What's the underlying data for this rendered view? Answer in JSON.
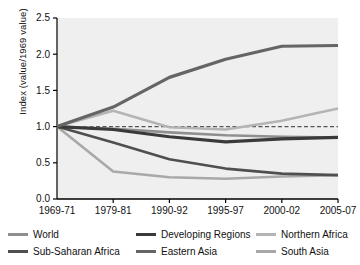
{
  "chart_data": {
    "type": "line",
    "title": "",
    "xlabel": "",
    "ylabel": "Index  (value/1969 value)",
    "categories": [
      "1969-71",
      "1979-81",
      "1990-92",
      "1995-97",
      "2000-02",
      "2005-07"
    ],
    "ylim": [
      0.0,
      2.5
    ],
    "yticks": [
      "0.0",
      "0.5",
      "1.0",
      "1.5",
      "2.0",
      "2.5"
    ],
    "ytick_values": [
      0.0,
      0.5,
      1.0,
      1.5,
      2.0,
      2.5
    ],
    "grid": false,
    "legend_position": "below",
    "reference_line": {
      "value": 1.0,
      "style": "dashed",
      "color": "#555555"
    },
    "plot_background": "#efefef",
    "series": [
      {
        "name": "World",
        "color": "#8f8f8f",
        "width": 2.6,
        "values": [
          1.0,
          0.97,
          0.92,
          0.88,
          0.86,
          0.85
        ]
      },
      {
        "name": "Developing Regions",
        "color": "#3a3a3a",
        "width": 3.2,
        "values": [
          1.0,
          0.96,
          0.86,
          0.79,
          0.83,
          0.85
        ]
      },
      {
        "name": "Northern Africa",
        "color": "#b4b4b4",
        "width": 2.6,
        "values": [
          1.0,
          1.22,
          0.99,
          0.96,
          1.08,
          1.25
        ]
      },
      {
        "name": "Sub-Saharan Africa",
        "color": "#4f4f4f",
        "width": 2.6,
        "values": [
          1.0,
          0.78,
          0.55,
          0.42,
          0.35,
          0.33
        ]
      },
      {
        "name": "Eastern Asia",
        "color": "#656565",
        "width": 3.2,
        "values": [
          1.0,
          1.27,
          1.68,
          1.93,
          2.11,
          2.12
        ]
      },
      {
        "name": "South Asia",
        "color": "#a8a8a8",
        "width": 2.6,
        "values": [
          1.0,
          0.38,
          0.3,
          0.28,
          0.31,
          0.33
        ]
      }
    ]
  },
  "legend": {
    "entries": [
      {
        "label": "World"
      },
      {
        "label": "Developing Regions"
      },
      {
        "label": "Northern Africa"
      },
      {
        "label": "Sub-Saharan Africa"
      },
      {
        "label": "Eastern Asia"
      },
      {
        "label": "South Asia"
      }
    ]
  }
}
